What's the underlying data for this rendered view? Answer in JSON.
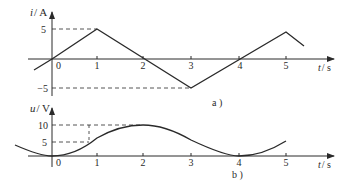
{
  "figure_a": {
    "y_label_var": "i",
    "y_label_unit": "/ A",
    "y_ticks": [
      "5",
      "−5"
    ],
    "x_ticks": [
      "0",
      "1",
      "2",
      "3",
      "4",
      "5"
    ],
    "x_label_var": "t",
    "x_label_unit": "/ s",
    "caption": "a )",
    "waveform": "triangular",
    "points": [
      [
        -0.4,
        -2.4
      ],
      [
        0,
        0
      ],
      [
        1,
        5
      ],
      [
        3,
        -5
      ],
      [
        5,
        5
      ],
      [
        5.4,
        3
      ]
    ]
  },
  "figure_b": {
    "y_label_var": "u",
    "y_label_unit": "/ V",
    "y_ticks": [
      "10",
      "5"
    ],
    "x_ticks": [
      "0",
      "1",
      "2",
      "3",
      "4",
      "5"
    ],
    "x_label_var": "t",
    "x_label_unit": "/ s",
    "caption": "b )",
    "waveform": "smooth (parabolic segments)",
    "key_points": [
      [
        0,
        0
      ],
      [
        0.8,
        5
      ],
      [
        2,
        10
      ],
      [
        4,
        0
      ],
      [
        5,
        5
      ]
    ]
  },
  "colors": {
    "line": "#2a2a2a",
    "background": "#ffffff"
  }
}
